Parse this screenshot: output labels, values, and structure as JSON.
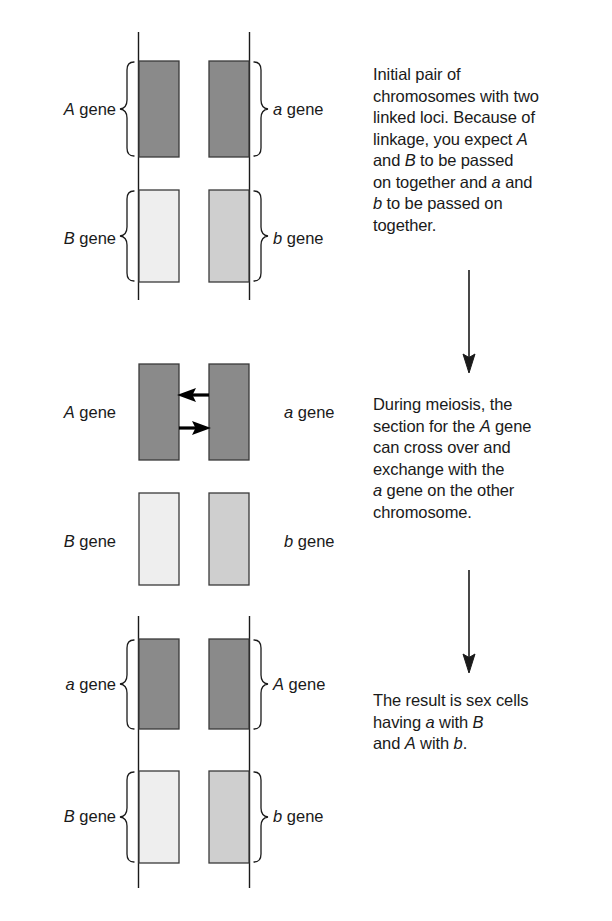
{
  "figure": {
    "background_color": "#ffffff",
    "line_color": "#1a1a1a",
    "colors": {
      "dark_allele_fill": "#8a8a8a",
      "light_allele_fill": "#eeeeee",
      "mid_allele_fill": "#cfcfcf",
      "outline": "#3a3a3a",
      "text": "#1a1a1a"
    }
  },
  "panels": [
    {
      "id": "panel-initial",
      "stage_name": "initial-pair-of-chromosomes",
      "labels": {
        "left_top": {
          "symbol": "A",
          "word": "gene",
          "text": "A gene"
        },
        "left_bottom": {
          "symbol": "B",
          "word": "gene",
          "text": "B gene"
        },
        "right_top": {
          "symbol": "a",
          "word": "gene",
          "text": "a gene"
        },
        "right_bottom": {
          "symbol": "b",
          "word": "gene",
          "text": "b gene"
        }
      },
      "braces": {
        "left_top": "brace-right-facing",
        "left_bottom": "brace-right-facing",
        "right_top": "brace-left-facing",
        "right_bottom": "brace-left-facing"
      },
      "chromosomes": [
        {
          "name": "left-chromosome",
          "segments": [
            {
              "allele": "A",
              "shade": "dark"
            },
            {
              "allele": "B",
              "shade": "light"
            }
          ]
        },
        {
          "name": "right-chromosome",
          "segments": [
            {
              "allele": "a",
              "shade": "dark"
            },
            {
              "allele": "b",
              "shade": "mid"
            }
          ]
        }
      ],
      "caption": {
        "lines": [
          "Initial pair of",
          "chromosomes with two",
          "linked loci. Because of",
          "linkage, you expect A",
          "and B to be passed",
          "on together and a and",
          "b to be passed on",
          "together."
        ],
        "plain_text": "Initial pair of chromosomes with two linked loci. Because of linkage, you expect A and B to be passed on together and a and b to be passed on together."
      }
    },
    {
      "id": "panel-meiosis",
      "stage_name": "crossing-over-during-meiosis",
      "labels": {
        "left_top": {
          "symbol": "A",
          "word": "gene",
          "text": "A gene"
        },
        "left_bottom": {
          "symbol": "B",
          "word": "gene",
          "text": "B gene"
        },
        "right_top": {
          "symbol": "a",
          "word": "gene",
          "text": "a gene"
        },
        "right_bottom": {
          "symbol": "b",
          "word": "gene",
          "text": "b gene"
        }
      },
      "braces": {
        "left_top": "none",
        "left_bottom": "none",
        "right_top": "none",
        "right_bottom": "none"
      },
      "exchange_arrows": [
        {
          "name": "arrow-a-to-left",
          "direction": "left"
        },
        {
          "name": "arrow-A-to-right",
          "direction": "right"
        }
      ],
      "chromosomes": [
        {
          "name": "left-chromosome",
          "segments": [
            {
              "allele": "A",
              "shade": "dark"
            },
            {
              "allele": "B",
              "shade": "light"
            }
          ]
        },
        {
          "name": "right-chromosome",
          "segments": [
            {
              "allele": "a",
              "shade": "dark"
            },
            {
              "allele": "b",
              "shade": "mid"
            }
          ]
        }
      ],
      "caption": {
        "lines": [
          "During meiosis, the",
          "section for the A gene",
          "can cross over and",
          "exchange with the",
          "a gene on the other",
          "chromosome."
        ],
        "plain_text": "During meiosis, the section for the A gene can cross over and exchange with the a gene on the other chromosome."
      }
    },
    {
      "id": "panel-result",
      "stage_name": "resulting-recombinant-sex-cells",
      "labels": {
        "left_top": {
          "symbol": "a",
          "word": "gene",
          "text": "a gene"
        },
        "left_bottom": {
          "symbol": "B",
          "word": "gene",
          "text": "B gene"
        },
        "right_top": {
          "symbol": "A",
          "word": "gene",
          "text": "A gene"
        },
        "right_bottom": {
          "symbol": "b",
          "word": "gene",
          "text": "b gene"
        }
      },
      "braces": {
        "left_top": "brace-right-facing",
        "left_bottom": "brace-right-facing",
        "right_top": "brace-left-facing",
        "right_bottom": "brace-left-facing"
      },
      "chromosomes": [
        {
          "name": "left-chromosome",
          "segments": [
            {
              "allele": "a",
              "shade": "dark"
            },
            {
              "allele": "B",
              "shade": "light"
            }
          ]
        },
        {
          "name": "right-chromosome",
          "segments": [
            {
              "allele": "A",
              "shade": "dark"
            },
            {
              "allele": "b",
              "shade": "mid"
            }
          ]
        }
      ],
      "caption": {
        "lines": [
          "The result is sex cells",
          "having a with B",
          "and A with b."
        ],
        "plain_text": "The result is sex cells having a with B and A with b."
      }
    }
  ],
  "flow_arrows": [
    {
      "name": "flow-arrow-initial-to-meiosis",
      "direction": "down"
    },
    {
      "name": "flow-arrow-meiosis-to-result",
      "direction": "down"
    }
  ]
}
